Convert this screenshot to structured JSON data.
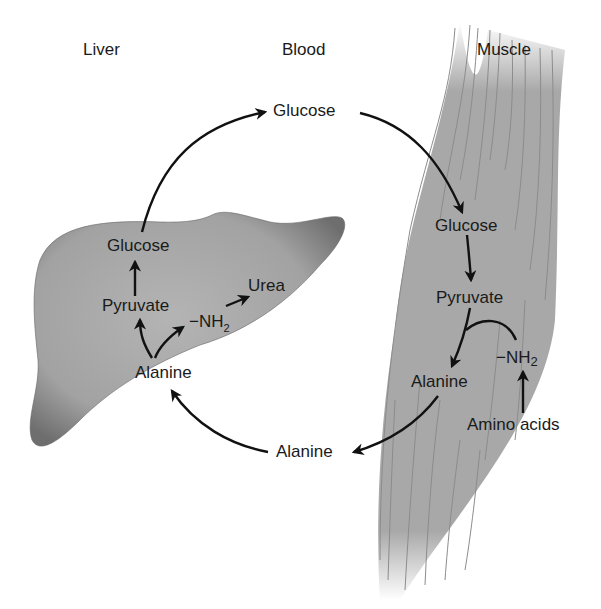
{
  "columns": {
    "liver": "Liver",
    "blood": "Blood",
    "muscle": "Muscle"
  },
  "liver": {
    "glucose": "Glucose",
    "pyruvate": "Pyruvate",
    "amine": "−NH",
    "amine_sub": "2",
    "urea": "Urea",
    "alanine": "Alanine"
  },
  "blood": {
    "glucose": "Glucose",
    "alanine": "Alanine"
  },
  "muscle": {
    "glucose": "Glucose",
    "pyruvate": "Pyruvate",
    "alanine": "Alanine",
    "amine": "−NH",
    "amine_sub": "2",
    "amino_acids": "Amino acids"
  },
  "colors": {
    "liver_fill": "#9a9a9a",
    "muscle_fill": "#a6a6a6",
    "arrow": "#111111"
  }
}
